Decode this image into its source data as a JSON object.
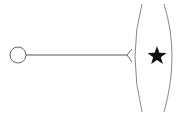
{
  "diagram": {
    "type": "uml-interface-connection",
    "canvas": {
      "width": 181,
      "height": 117,
      "background": "#ffffff"
    },
    "provided_interface": {
      "shape": "circle",
      "cx": 18,
      "cy": 55,
      "r": 8,
      "stroke": "#666666"
    },
    "connector": {
      "x1": 26,
      "y1": 55,
      "x2": 127,
      "y2": 55,
      "stroke": "#555555"
    },
    "required_interface": {
      "shape": "chevron",
      "points": "132,49 127,55 132,62",
      "stroke": "#666666"
    },
    "left_bracket": {
      "shape": "arc",
      "d": "M 142 4 Q 128 55 142 112",
      "stroke": "#888888"
    },
    "right_bracket": {
      "shape": "arc",
      "d": "M 164 4 Q 180 55 164 112",
      "stroke": "#888888"
    },
    "symbol": {
      "glyph": "★",
      "name": "star-icon",
      "cx": 157,
      "cy": 56,
      "fill": "#111111"
    }
  }
}
